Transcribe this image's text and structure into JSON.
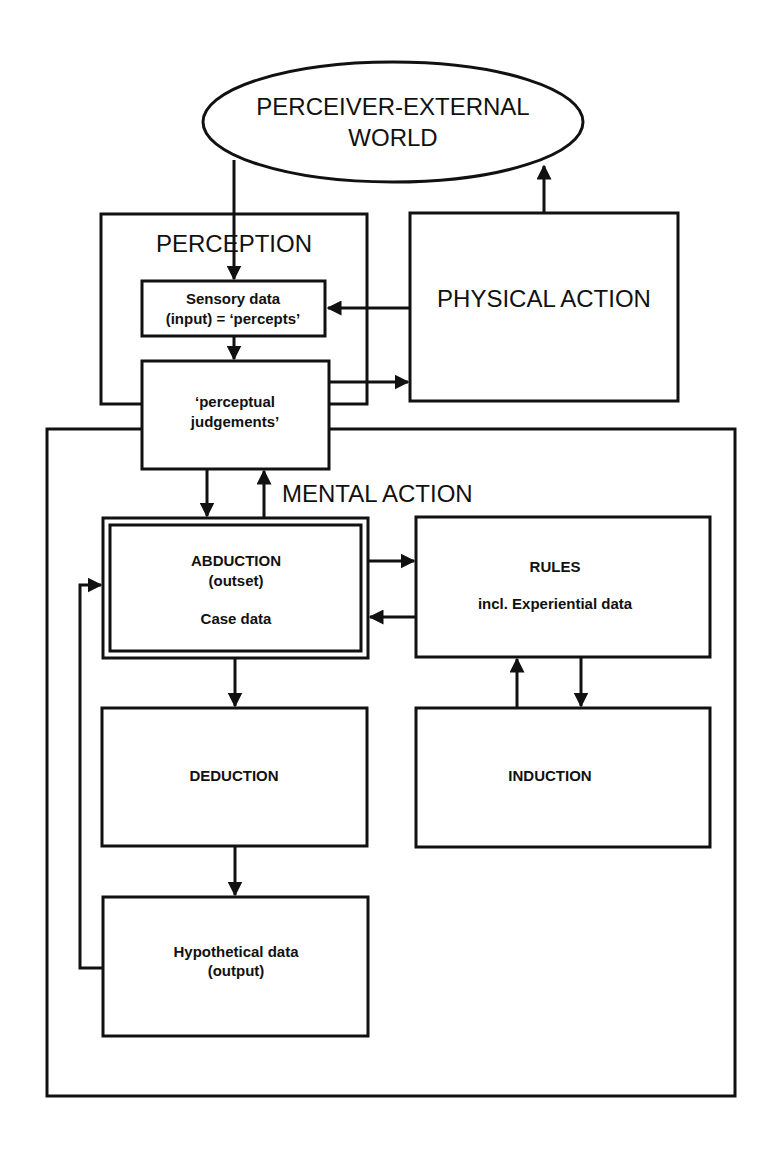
{
  "diagram": {
    "nodes": {
      "world": {
        "line1": "PERCEIVER-EXTERNAL",
        "line2": "WORLD"
      },
      "perception": {
        "label": "PERCEPTION"
      },
      "sensory": {
        "line1": "Sensory data",
        "line2": "(input) = ‘percepts’"
      },
      "judgements": {
        "line1": "‘perceptual",
        "line2": "judgements’"
      },
      "physical_action": {
        "label": "PHYSICAL ACTION"
      },
      "mental_action": {
        "label": "MENTAL ACTION"
      },
      "abduction": {
        "line1": "ABDUCTION",
        "line2": "(outset)",
        "line3": "Case data"
      },
      "rules": {
        "line1": "RULES",
        "line2": "incl. Experiential data"
      },
      "deduction": {
        "label": "DEDUCTION"
      },
      "induction": {
        "label": "INDUCTION"
      },
      "hypothetical": {
        "line1": "Hypothetical data",
        "line2": "(output)"
      }
    },
    "edges": [
      {
        "from": "world",
        "to": "sensory"
      },
      {
        "from": "physical_action",
        "to": "world"
      },
      {
        "from": "physical_action",
        "to": "sensory"
      },
      {
        "from": "sensory",
        "to": "judgements"
      },
      {
        "from": "judgements",
        "to": "physical_action"
      },
      {
        "from": "judgements",
        "to": "abduction"
      },
      {
        "from": "abduction",
        "to": "judgements"
      },
      {
        "from": "abduction",
        "to": "rules"
      },
      {
        "from": "rules",
        "to": "abduction"
      },
      {
        "from": "abduction",
        "to": "deduction"
      },
      {
        "from": "deduction",
        "to": "hypothetical"
      },
      {
        "from": "hypothetical",
        "to": "abduction"
      },
      {
        "from": "induction",
        "to": "rules"
      },
      {
        "from": "rules",
        "to": "induction"
      }
    ],
    "colors": {
      "stroke": "#111111",
      "background": "#ffffff"
    }
  }
}
